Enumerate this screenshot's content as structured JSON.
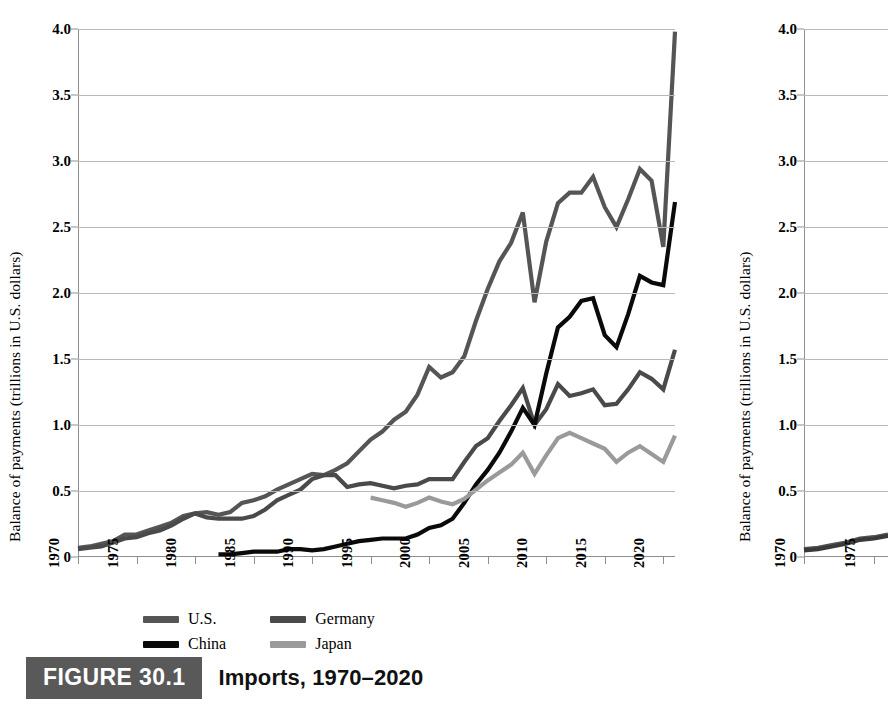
{
  "figure": {
    "tag": "FIGURE 30.1",
    "title": "Imports, 1970–2020",
    "tag_color": "#595959",
    "second_figure_tag": "FIGURE 30"
  },
  "axes": {
    "ylabel": "Balance of payments (trillions in U.S. dollars)",
    "yticks": [
      "0",
      "0.5",
      "1.0",
      "1.5",
      "2.0",
      "2.5",
      "3.0",
      "3.5",
      "4.0"
    ],
    "ytick_values": [
      0,
      0.5,
      1.0,
      1.5,
      2.0,
      2.5,
      3.0,
      3.5,
      4.0
    ],
    "xticks": [
      "1970",
      "1975",
      "1980",
      "1985",
      "1990",
      "1995",
      "2000",
      "2005",
      "2010",
      "2015",
      "2020"
    ],
    "xtick_values": [
      1970,
      1975,
      1980,
      1985,
      1990,
      1995,
      2000,
      2005,
      2010,
      2015,
      2020
    ]
  },
  "legend": {
    "position": "below-axis",
    "items": [
      {
        "label": "U.S.",
        "color": "#555555"
      },
      {
        "label": "Germany",
        "color": "#4a4a4a"
      },
      {
        "label": "China",
        "color": "#0a0a0a"
      },
      {
        "label": "Japan",
        "color": "#9a9a9a"
      }
    ]
  },
  "chart_data": {
    "type": "line",
    "title": "Imports, 1970–2020",
    "xlabel": "",
    "ylabel": "Balance of payments (trillions in U.S. dollars)",
    "xlim": [
      1970,
      2021
    ],
    "ylim": [
      0,
      4.0
    ],
    "grid": true,
    "legend_position": "below-axis",
    "x": [
      1970,
      1971,
      1972,
      1973,
      1974,
      1975,
      1976,
      1977,
      1978,
      1979,
      1980,
      1981,
      1982,
      1983,
      1984,
      1985,
      1986,
      1987,
      1988,
      1989,
      1990,
      1991,
      1992,
      1993,
      1994,
      1995,
      1996,
      1997,
      1998,
      1999,
      2000,
      2001,
      2002,
      2003,
      2004,
      2005,
      2006,
      2007,
      2008,
      2009,
      2010,
      2011,
      2012,
      2013,
      2014,
      2015,
      2016,
      2017,
      2018,
      2019,
      2020,
      2021
    ],
    "series": [
      {
        "name": "U.S.",
        "color": "#555555",
        "values": [
          0.07,
          0.08,
          0.1,
          0.12,
          0.17,
          0.17,
          0.2,
          0.23,
          0.26,
          0.31,
          0.33,
          0.34,
          0.32,
          0.34,
          0.41,
          0.43,
          0.46,
          0.51,
          0.55,
          0.59,
          0.63,
          0.62,
          0.66,
          0.71,
          0.8,
          0.89,
          0.95,
          1.04,
          1.1,
          1.23,
          1.44,
          1.36,
          1.4,
          1.52,
          1.79,
          2.03,
          2.24,
          2.38,
          2.61,
          1.93,
          2.39,
          2.68,
          2.76,
          2.76,
          2.88,
          2.65,
          2.5,
          2.71,
          2.94,
          2.85,
          2.35,
          3.98
        ]
      },
      {
        "name": "Germany",
        "color": "#4a4a4a",
        "values": [
          0.06,
          0.07,
          0.08,
          0.11,
          0.14,
          0.15,
          0.18,
          0.2,
          0.24,
          0.29,
          0.33,
          0.3,
          0.29,
          0.29,
          0.29,
          0.31,
          0.36,
          0.43,
          0.47,
          0.51,
          0.59,
          0.62,
          0.62,
          0.53,
          0.55,
          0.56,
          0.54,
          0.52,
          0.54,
          0.55,
          0.59,
          0.59,
          0.59,
          0.72,
          0.84,
          0.9,
          1.03,
          1.15,
          1.28,
          1.0,
          1.12,
          1.31,
          1.22,
          1.24,
          1.27,
          1.15,
          1.16,
          1.27,
          1.4,
          1.35,
          1.27,
          1.57
        ]
      },
      {
        "name": "China",
        "color": "#0a0a0a",
        "values": [
          null,
          null,
          null,
          null,
          null,
          null,
          null,
          null,
          null,
          null,
          null,
          null,
          0.02,
          0.02,
          0.03,
          0.04,
          0.04,
          0.04,
          0.06,
          0.06,
          0.05,
          0.06,
          0.08,
          0.1,
          0.12,
          0.13,
          0.14,
          0.14,
          0.14,
          0.17,
          0.22,
          0.24,
          0.29,
          0.41,
          0.55,
          0.66,
          0.79,
          0.95,
          1.13,
          1.0,
          1.39,
          1.74,
          1.82,
          1.94,
          1.96,
          1.68,
          1.59,
          1.84,
          2.13,
          2.08,
          2.06,
          2.69
        ]
      },
      {
        "name": "Japan",
        "color": "#9a9a9a",
        "values": [
          null,
          null,
          null,
          null,
          null,
          null,
          null,
          null,
          null,
          null,
          null,
          null,
          null,
          null,
          null,
          null,
          null,
          null,
          null,
          null,
          null,
          null,
          null,
          null,
          null,
          0.45,
          0.43,
          0.41,
          0.38,
          0.41,
          0.45,
          0.42,
          0.4,
          0.44,
          0.51,
          0.58,
          0.64,
          0.7,
          0.79,
          0.63,
          0.77,
          0.9,
          0.94,
          0.9,
          0.86,
          0.82,
          0.72,
          0.79,
          0.84,
          0.78,
          0.72,
          0.92
        ]
      }
    ]
  },
  "chart_right": {
    "type": "line",
    "cropped": true,
    "ylabel": "Balance of payments (trillions in U.S. dollars)",
    "yticks": [
      "0",
      "0.5",
      "1.0",
      "1.5",
      "2.0",
      "2.5",
      "3.0",
      "3.5",
      "4.0"
    ],
    "xticks": [
      "1970",
      "1975"
    ],
    "series": [
      {
        "name": "series-a",
        "color": "#555555",
        "values": [
          0.06,
          0.07,
          0.09,
          0.11,
          0.14,
          0.15,
          0.17
        ]
      },
      {
        "name": "series-b",
        "color": "#3a3a3a",
        "values": [
          0.05,
          0.06,
          0.08,
          0.1,
          0.13,
          0.14,
          0.16
        ]
      }
    ]
  }
}
